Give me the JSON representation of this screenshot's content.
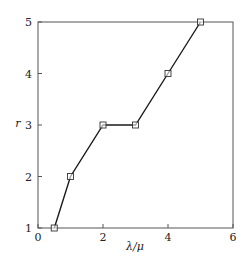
{
  "chart_data": {
    "type": "line",
    "title": "",
    "xlabel": "λ/μ",
    "ylabel": "r",
    "xlim": [
      0,
      6
    ],
    "ylim": [
      1,
      5
    ],
    "xticks": [
      0,
      2,
      4,
      6
    ],
    "yticks": [
      1,
      2,
      3,
      4,
      5
    ],
    "xtick_labels": [
      "0",
      "2",
      "4",
      "6"
    ],
    "ytick_labels": [
      "1",
      "2",
      "3",
      "4",
      "5"
    ],
    "grid": false,
    "legend": null,
    "series": [
      {
        "name": "r",
        "marker": "square",
        "color": "#1a1a1a",
        "x": [
          0.5,
          1,
          2,
          3,
          4,
          5
        ],
        "y": [
          1,
          2,
          3,
          3,
          4,
          5
        ]
      }
    ]
  }
}
